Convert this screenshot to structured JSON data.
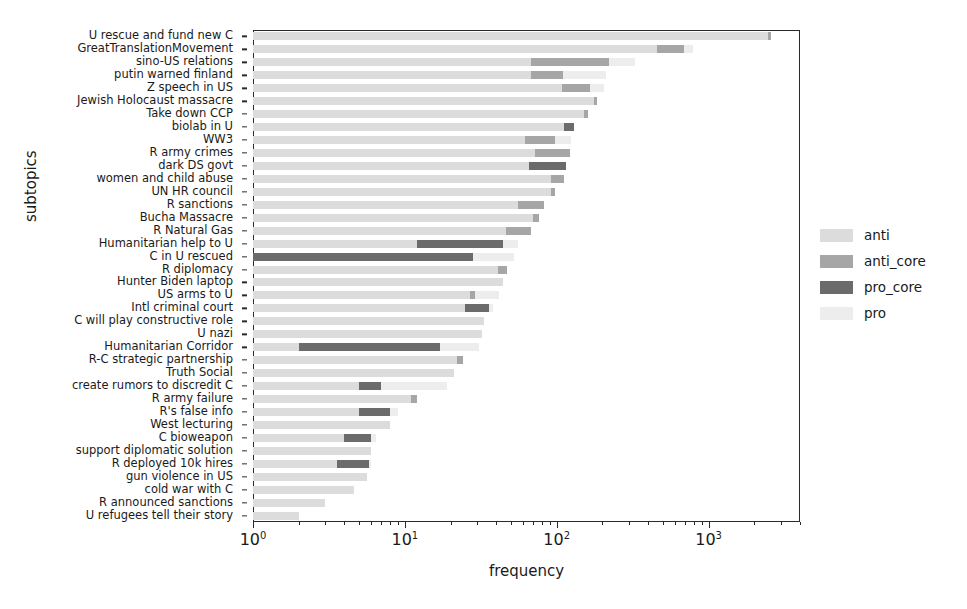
{
  "chart_data": {
    "type": "bar",
    "orientation": "horizontal",
    "stacked": true,
    "title": "",
    "xlabel": "frequency",
    "ylabel": "subtopics",
    "xscale": "log",
    "xlim": [
      1,
      4000
    ],
    "grid": false,
    "legend_position": "right",
    "series": [
      {
        "name": "anti",
        "color": "#dcdcdc"
      },
      {
        "name": "anti_core",
        "color": "#a6a6a6"
      },
      {
        "name": "pro_core",
        "color": "#6b6b6b"
      },
      {
        "name": "pro",
        "color": "#ededed"
      }
    ],
    "xticks": [
      {
        "value": 1,
        "label_mantissa": "10",
        "label_exponent": "0"
      },
      {
        "value": 10,
        "label_mantissa": "10",
        "label_exponent": "1"
      },
      {
        "value": 100,
        "label_mantissa": "10",
        "label_exponent": "2"
      },
      {
        "value": 1000,
        "label_mantissa": "10",
        "label_exponent": "3"
      }
    ],
    "categories": [
      "U rescue and fund new C",
      "GreatTranslationMovement",
      "sino-US relations",
      "putin warned finland",
      "Z speech in US",
      "Jewish Holocaust massacre",
      "Take down CCP",
      "biolab in U",
      "WW3",
      "R army crimes",
      "dark DS govt",
      "women and child abuse",
      "UN HR council",
      "R sanctions",
      "Bucha Massacre",
      "R Natural Gas",
      "Humanitarian help to U",
      "C in U rescued",
      "R diplomacy",
      "Hunter Biden laptop",
      "US arms to U",
      "Intl criminal court",
      "C will play constructive role",
      "U nazi",
      "Humanitarian Corridor",
      "R-C strategic partnership",
      "Truth Social",
      "create rumors to discredit C",
      "R army failure",
      "R's false info",
      "West lecturing",
      "C bioweapon",
      "support diplomatic solution",
      "R deployed 10k hires",
      "gun violence in US",
      "cold war with C",
      "R announced sanctions",
      "U refugees tell their story"
    ],
    "rows": [
      {
        "category": "U rescue and fund new C",
        "total": 2560,
        "segments": [
          {
            "name": "anti",
            "value": 2450
          },
          {
            "name": "anti_core",
            "value": 110
          }
        ]
      },
      {
        "category": "GreatTranslationMovement",
        "total": 790,
        "segments": [
          {
            "name": "anti",
            "value": 460
          },
          {
            "name": "anti_core",
            "value": 230
          },
          {
            "name": "pro",
            "value": 100
          }
        ]
      },
      {
        "category": "sino-US relations",
        "total": 330,
        "segments": [
          {
            "name": "anti",
            "value": 68
          },
          {
            "name": "anti_core",
            "value": 152
          },
          {
            "name": "pro",
            "value": 110
          }
        ]
      },
      {
        "category": "putin warned finland",
        "total": 210,
        "segments": [
          {
            "name": "anti",
            "value": 68
          },
          {
            "name": "anti_core",
            "value": 42
          },
          {
            "name": "pro",
            "value": 100
          }
        ]
      },
      {
        "category": "Z speech in US",
        "total": 205,
        "segments": [
          {
            "name": "anti",
            "value": 108
          },
          {
            "name": "anti_core",
            "value": 57
          },
          {
            "name": "pro",
            "value": 40
          }
        ]
      },
      {
        "category": "Jewish Holocaust massacre",
        "total": 185,
        "segments": [
          {
            "name": "anti",
            "value": 175
          },
          {
            "name": "anti_core",
            "value": 10
          }
        ]
      },
      {
        "category": "Take down CCP",
        "total": 160,
        "segments": [
          {
            "name": "anti",
            "value": 152
          },
          {
            "name": "anti_core",
            "value": 8
          }
        ]
      },
      {
        "category": "biolab in U",
        "total": 130,
        "segments": [
          {
            "name": "anti",
            "value": 112
          },
          {
            "name": "pro_core",
            "value": 18
          }
        ]
      },
      {
        "category": "WW3",
        "total": 125,
        "segments": [
          {
            "name": "anti",
            "value": 62
          },
          {
            "name": "anti_core",
            "value": 36
          },
          {
            "name": "pro",
            "value": 27
          }
        ]
      },
      {
        "category": "R army crimes",
        "total": 122,
        "segments": [
          {
            "name": "anti",
            "value": 72
          },
          {
            "name": "anti_core",
            "value": 50
          }
        ]
      },
      {
        "category": "dark DS govt",
        "total": 115,
        "segments": [
          {
            "name": "anti",
            "value": 66
          },
          {
            "name": "pro_core",
            "value": 49
          }
        ]
      },
      {
        "category": "women and child abuse",
        "total": 112,
        "segments": [
          {
            "name": "anti",
            "value": 92
          },
          {
            "name": "anti_core",
            "value": 20
          }
        ]
      },
      {
        "category": "UN HR council",
        "total": 98,
        "segments": [
          {
            "name": "anti",
            "value": 92
          },
          {
            "name": "anti_core",
            "value": 6
          }
        ]
      },
      {
        "category": "R sanctions",
        "total": 82,
        "segments": [
          {
            "name": "anti",
            "value": 56
          },
          {
            "name": "anti_core",
            "value": 26
          }
        ]
      },
      {
        "category": "Bucha Massacre",
        "total": 76,
        "segments": [
          {
            "name": "anti",
            "value": 70
          },
          {
            "name": "anti_core",
            "value": 6
          }
        ]
      },
      {
        "category": "R Natural Gas",
        "total": 68,
        "segments": [
          {
            "name": "anti",
            "value": 46
          },
          {
            "name": "anti_core",
            "value": 22
          }
        ]
      },
      {
        "category": "Humanitarian help to U",
        "total": 56,
        "segments": [
          {
            "name": "anti",
            "value": 12
          },
          {
            "name": "pro_core",
            "value": 32
          },
          {
            "name": "pro",
            "value": 12
          }
        ]
      },
      {
        "category": "C in U rescued",
        "total": 52,
        "segments": [
          {
            "name": "pro_core",
            "value": 28
          },
          {
            "name": "pro",
            "value": 24
          }
        ]
      },
      {
        "category": "R diplomacy",
        "total": 47,
        "segments": [
          {
            "name": "anti",
            "value": 41
          },
          {
            "name": "anti_core",
            "value": 6
          }
        ]
      },
      {
        "category": "Hunter Biden laptop",
        "total": 44,
        "segments": [
          {
            "name": "anti",
            "value": 44
          }
        ]
      },
      {
        "category": "US arms to U",
        "total": 42,
        "segments": [
          {
            "name": "anti",
            "value": 27
          },
          {
            "name": "anti_core",
            "value": 2
          },
          {
            "name": "pro",
            "value": 13
          }
        ]
      },
      {
        "category": "Intl criminal court",
        "total": 38,
        "segments": [
          {
            "name": "anti",
            "value": 25
          },
          {
            "name": "pro_core",
            "value": 11
          },
          {
            "name": "pro",
            "value": 2
          }
        ]
      },
      {
        "category": "C will play constructive role",
        "total": 33,
        "segments": [
          {
            "name": "anti",
            "value": 33
          }
        ]
      },
      {
        "category": "U nazi",
        "total": 32,
        "segments": [
          {
            "name": "anti",
            "value": 32
          }
        ]
      },
      {
        "category": "Humanitarian Corridor",
        "total": 31,
        "segments": [
          {
            "name": "anti",
            "value": 2
          },
          {
            "name": "pro_core",
            "value": 15
          },
          {
            "name": "pro",
            "value": 14
          }
        ]
      },
      {
        "category": "R-C strategic partnership",
        "total": 24,
        "segments": [
          {
            "name": "anti",
            "value": 22
          },
          {
            "name": "anti_core",
            "value": 2
          }
        ]
      },
      {
        "category": "Truth Social",
        "total": 21,
        "segments": [
          {
            "name": "anti",
            "value": 21
          }
        ]
      },
      {
        "category": "create rumors to discredit C",
        "total": 19,
        "segments": [
          {
            "name": "anti",
            "value": 5
          },
          {
            "name": "pro_core",
            "value": 2
          },
          {
            "name": "pro",
            "value": 12
          }
        ]
      },
      {
        "category": "R army failure",
        "total": 12,
        "segments": [
          {
            "name": "anti",
            "value": 11
          },
          {
            "name": "anti_core",
            "value": 1
          }
        ]
      },
      {
        "category": "R's false info",
        "total": 9,
        "segments": [
          {
            "name": "anti",
            "value": 5
          },
          {
            "name": "pro_core",
            "value": 3
          },
          {
            "name": "pro",
            "value": 1
          }
        ]
      },
      {
        "category": "West lecturing",
        "total": 8,
        "segments": [
          {
            "name": "anti",
            "value": 8
          }
        ]
      },
      {
        "category": "C bioweapon",
        "total": 6.5,
        "segments": [
          {
            "name": "anti",
            "value": 4
          },
          {
            "name": "pro_core",
            "value": 2
          },
          {
            "name": "pro",
            "value": 0.5
          }
        ]
      },
      {
        "category": "support diplomatic solution",
        "total": 6,
        "segments": [
          {
            "name": "anti",
            "value": 6
          }
        ]
      },
      {
        "category": "R deployed 10k hires",
        "total": 6,
        "segments": [
          {
            "name": "anti",
            "value": 3.6
          },
          {
            "name": "pro_core",
            "value": 2.2
          },
          {
            "name": "pro",
            "value": 0.2
          }
        ]
      },
      {
        "category": "gun violence in US",
        "total": 5.6,
        "segments": [
          {
            "name": "anti",
            "value": 5.6
          }
        ]
      },
      {
        "category": "cold war with C",
        "total": 4.6,
        "segments": [
          {
            "name": "anti",
            "value": 4.6
          }
        ]
      },
      {
        "category": "R announced sanctions",
        "total": 3.0,
        "segments": [
          {
            "name": "anti",
            "value": 3.0
          }
        ]
      },
      {
        "category": "U refugees tell their story",
        "total": 2.0,
        "segments": [
          {
            "name": "anti",
            "value": 2.0
          }
        ]
      }
    ]
  },
  "legend": {
    "items": [
      {
        "label": "anti",
        "color": "#dcdcdc"
      },
      {
        "label": "anti_core",
        "color": "#a6a6a6"
      },
      {
        "label": "pro_core",
        "color": "#6b6b6b"
      },
      {
        "label": "pro",
        "color": "#ededed"
      }
    ]
  }
}
